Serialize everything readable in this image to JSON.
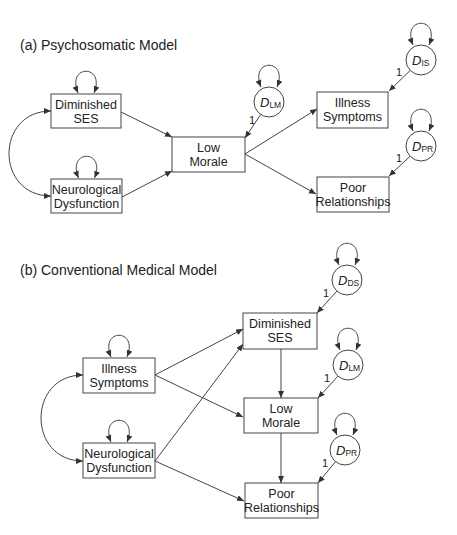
{
  "panels": [
    {
      "id": "a",
      "title": "(a)  Psychosomatic Model",
      "title_pos": [
        20,
        50
      ],
      "nodes": [
        {
          "id": "dses",
          "lines": [
            "Diminished",
            "SES"
          ],
          "x": 51,
          "y": 94,
          "w": 70,
          "h": 34,
          "self_loop": true
        },
        {
          "id": "nd",
          "lines": [
            "Neurological",
            "Dysfunction"
          ],
          "x": 51,
          "y": 179,
          "w": 71,
          "h": 34,
          "self_loop": true
        },
        {
          "id": "lm",
          "lines": [
            "Low",
            "Morale"
          ],
          "x": 172,
          "y": 137,
          "w": 73,
          "h": 35,
          "self_loop": false
        },
        {
          "id": "is",
          "lines": [
            "Illness",
            "Symptoms"
          ],
          "x": 317,
          "y": 92,
          "w": 71,
          "h": 36,
          "self_loop": false
        },
        {
          "id": "pr",
          "lines": [
            "Poor",
            "Relationships"
          ],
          "x": 317,
          "y": 177,
          "w": 72,
          "h": 35,
          "self_loop": false
        }
      ],
      "disturbances": [
        {
          "id": "d_lm",
          "var": "D",
          "sub": "LM",
          "cx": 269,
          "cy": 102,
          "r": 15,
          "target": [
            245,
            138
          ],
          "label": "1",
          "label_pos": [
            249,
            124
          ]
        },
        {
          "id": "d_is",
          "var": "D",
          "sub": "IS",
          "cx": 421,
          "cy": 60,
          "r": 15,
          "target": [
            389,
            91
          ],
          "label": "1",
          "label_pos": [
            396,
            76
          ]
        },
        {
          "id": "d_pr",
          "var": "D",
          "sub": "PR",
          "cx": 421,
          "cy": 146,
          "r": 15,
          "target": [
            389,
            176
          ],
          "label": "1",
          "label_pos": [
            396,
            162
          ]
        }
      ],
      "paths": [
        {
          "from": [
            121,
            112
          ],
          "to": [
            172,
            137
          ]
        },
        {
          "from": [
            122,
            197
          ],
          "to": [
            172,
            171
          ]
        },
        {
          "from": [
            245,
            154
          ],
          "to": [
            317,
            109
          ]
        },
        {
          "from": [
            245,
            154
          ],
          "to": [
            316,
            194
          ]
        }
      ],
      "covariance": {
        "from": [
          51,
          111
        ],
        "to": [
          51,
          196
        ],
        "ctrl_x": -5
      }
    },
    {
      "id": "b",
      "title": "(b)  Conventional Medical Model",
      "title_pos": [
        20,
        275
      ],
      "nodes": [
        {
          "id": "is",
          "lines": [
            "Illness",
            "Symptoms"
          ],
          "x": 83,
          "y": 358,
          "w": 72,
          "h": 35,
          "self_loop": true
        },
        {
          "id": "nd",
          "lines": [
            "Neurological",
            "Dysfunction"
          ],
          "x": 83,
          "y": 443,
          "w": 72,
          "h": 35,
          "self_loop": true
        },
        {
          "id": "dses",
          "lines": [
            "Diminished",
            "SES"
          ],
          "x": 243,
          "y": 313,
          "w": 74,
          "h": 36,
          "self_loop": false
        },
        {
          "id": "lm",
          "lines": [
            "Low",
            "Morale"
          ],
          "x": 244,
          "y": 398,
          "w": 74,
          "h": 35,
          "self_loop": false
        },
        {
          "id": "pr",
          "lines": [
            "Poor",
            "Relationships"
          ],
          "x": 245,
          "y": 483,
          "w": 73,
          "h": 35,
          "self_loop": false
        }
      ],
      "disturbances": [
        {
          "id": "d_ds",
          "var": "D",
          "sub": "DS",
          "cx": 347,
          "cy": 280,
          "r": 15,
          "target": [
            317,
            313
          ],
          "label": "1",
          "label_pos": [
            323,
            297
          ]
        },
        {
          "id": "d_lm",
          "var": "D",
          "sub": "LM",
          "cx": 348,
          "cy": 365,
          "r": 15,
          "target": [
            318,
            398
          ],
          "label": "1",
          "label_pos": [
            324,
            382
          ]
        },
        {
          "id": "d_pr",
          "var": "D",
          "sub": "PR",
          "cx": 345,
          "cy": 450,
          "r": 15,
          "target": [
            318,
            483
          ],
          "label": "1",
          "label_pos": [
            322,
            467
          ]
        }
      ],
      "paths": [
        {
          "from": [
            155,
            375
          ],
          "to": [
            243,
            329
          ]
        },
        {
          "from": [
            155,
            375
          ],
          "to": [
            243,
            417
          ]
        },
        {
          "from": [
            155,
            461
          ],
          "to": [
            243,
            344
          ]
        },
        {
          "from": [
            155,
            461
          ],
          "to": [
            244,
            501
          ]
        },
        {
          "from": [
            281,
            349
          ],
          "to": [
            281,
            398
          ]
        },
        {
          "from": [
            281,
            433
          ],
          "to": [
            281,
            483
          ]
        }
      ],
      "covariance": {
        "from": [
          83,
          375
        ],
        "to": [
          83,
          461
        ],
        "ctrl_x": 27
      }
    }
  ],
  "colors": {
    "stroke": "#444444",
    "text": "#222222",
    "background": "#ffffff"
  }
}
